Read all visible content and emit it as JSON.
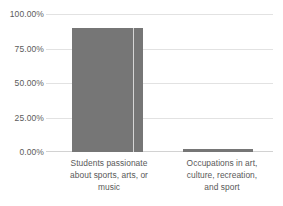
{
  "chart_data": {
    "type": "bar",
    "title": "",
    "subtitle": "",
    "xlabel": "",
    "ylabel": "",
    "categories": [
      "Students passionate about sports, arts, or music",
      "Occupations in art, culture, recreation, and sport"
    ],
    "values": [
      89.9,
      2.5
    ],
    "value_labels": [
      "89.90%",
      "2.50%"
    ],
    "ylim": [
      0,
      100
    ],
    "ytick_values": [
      0,
      25,
      50,
      75,
      100
    ],
    "ytick_labels": [
      "0.00%",
      "25.00%",
      "50.00%",
      "75.00%",
      "100.00%"
    ],
    "grid": true,
    "legend": false,
    "legend_position": "none",
    "series": [
      {
        "name": "",
        "values": [
          89.9,
          2.5
        ],
        "color": "#767676"
      }
    ],
    "colors": {
      "bar": "#767676",
      "gridline": "#e2e2e2",
      "axis": "#d2d2d2",
      "tick_text": "#5b5b5b",
      "category_text": "#595959",
      "background": "#ffffff"
    }
  },
  "axis": {
    "y": {
      "ticks": [
        {
          "label": "100.00%",
          "value": 100
        },
        {
          "label": "75.00%",
          "value": 75
        },
        {
          "label": "50.00%",
          "value": 50
        },
        {
          "label": "25.00%",
          "value": 25
        },
        {
          "label": "0.00%",
          "value": 0
        }
      ]
    },
    "x": {
      "categories": [
        {
          "line1": "Students passionate",
          "line2": "about sports, arts, or",
          "line3": "music"
        },
        {
          "line1": "Occupations in art,",
          "line2": "culture, recreation,",
          "line3": "and sport"
        }
      ]
    }
  }
}
